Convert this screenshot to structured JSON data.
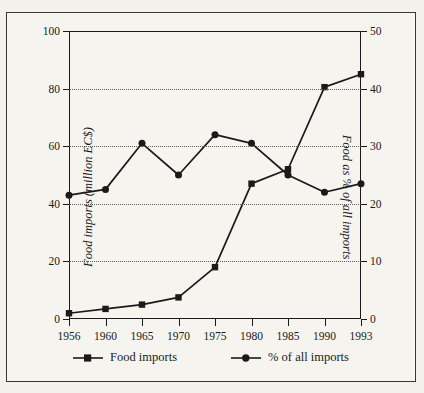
{
  "chart_data": {
    "type": "line",
    "title": "",
    "xlabel": "",
    "categories": [
      "1956",
      "1960",
      "1965",
      "1970",
      "1975",
      "1980",
      "1985",
      "1990",
      "1993"
    ],
    "grid": true,
    "legend_position": "bottom",
    "series": [
      {
        "name": "Food imports",
        "marker": "square",
        "axis": "left",
        "ylabel": "Food imports (million EC$)",
        "ylim": [
          0,
          100
        ],
        "yticks": [
          0,
          20,
          40,
          60,
          80,
          100
        ],
        "values": [
          2,
          3.5,
          5,
          7.5,
          18,
          47,
          52,
          80.5,
          85
        ]
      },
      {
        "name": "% of all imports",
        "marker": "circle",
        "axis": "right",
        "ylabel": "Food as % of all imports",
        "ylim": [
          0,
          50
        ],
        "yticks": [
          0,
          10,
          20,
          30,
          40,
          50
        ],
        "values": [
          21.5,
          22.5,
          30.5,
          25,
          32,
          30.5,
          25,
          22,
          23.5
        ]
      }
    ]
  },
  "legend": {
    "items": [
      {
        "label": "Food imports",
        "marker": "square-marker"
      },
      {
        "label": "% of all imports",
        "marker": "circle-marker"
      }
    ]
  },
  "colors": {
    "ink": "#1a1a1a",
    "paper": "#f6f4ef",
    "grid": "#5a5a5a",
    "border": "#3a3632"
  }
}
